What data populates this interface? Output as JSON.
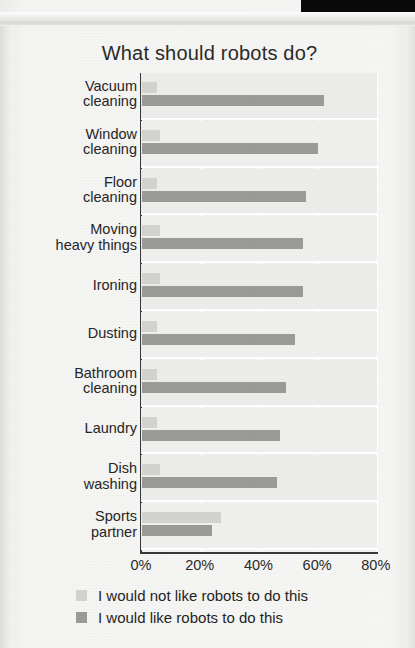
{
  "page": {
    "top_band_color": "#0a0a0a",
    "background_color": "#f2f2f0"
  },
  "chart_data": {
    "type": "bar",
    "orientation": "horizontal",
    "title": "What should robots do?",
    "xlabel": "",
    "ylabel": "",
    "xlim": [
      0,
      80
    ],
    "xticks": [
      0,
      20,
      40,
      60,
      80
    ],
    "xtick_labels": [
      "0%",
      "20%",
      "40%",
      "60%",
      "80%"
    ],
    "grid": true,
    "legend_position": "bottom",
    "categories": [
      "Vacuum cleaning",
      "Window cleaning",
      "Floor cleaning",
      "Moving heavy things",
      "Ironing",
      "Dusting",
      "Bathroom cleaning",
      "Laundry",
      "Dish washing",
      "Sports partner"
    ],
    "category_lines": [
      [
        "Vacuum",
        "cleaning"
      ],
      [
        "Window",
        "cleaning"
      ],
      [
        "Floor",
        "cleaning"
      ],
      [
        "Moving",
        "heavy things"
      ],
      [
        "Ironing"
      ],
      [
        "Dusting"
      ],
      [
        "Bathroom",
        "cleaning"
      ],
      [
        "Laundry"
      ],
      [
        "Dish",
        "washing"
      ],
      [
        "Sports",
        "partner"
      ]
    ],
    "series": [
      {
        "name": "I would not like robots to do this",
        "color": "#d2d2cf",
        "values": [
          5,
          6,
          5,
          6,
          6,
          5,
          5,
          5,
          6,
          27
        ]
      },
      {
        "name": "I would like robots to do this",
        "color": "#9a9a97",
        "values": [
          62,
          60,
          56,
          55,
          55,
          52,
          49,
          47,
          46,
          24
        ]
      }
    ]
  },
  "legend": {
    "entries": [
      {
        "label": "I would not like robots to do this",
        "color": "#d2d2cf"
      },
      {
        "label": "I would like robots to do this",
        "color": "#9a9a97"
      }
    ]
  }
}
